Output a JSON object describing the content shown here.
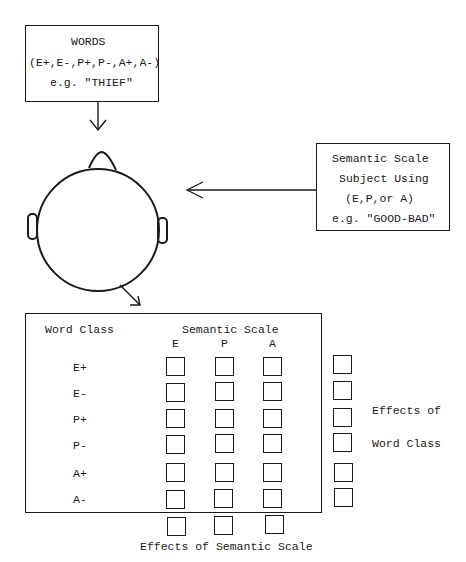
{
  "words_box": {
    "line1": "WORDS",
    "line2": "(E+,E-,P+,P-,A+,A-)",
    "line3": "e.g. \"THIEF\""
  },
  "scale_box": {
    "line1": "Semantic Scale",
    "line2": "Subject Using",
    "line3": "(E,P,or A)",
    "line4": "e.g. \"GOOD-BAD\""
  },
  "matrix": {
    "row_header": "Word Class",
    "col_header": "Semantic Scale",
    "columns": [
      "E",
      "P",
      "A"
    ],
    "rows": [
      "E+",
      "E-",
      "P+",
      "P-",
      "A+",
      "A-"
    ]
  },
  "labels": {
    "word_class_effects_1": "Effects of",
    "word_class_effects_2": "Word Class",
    "semantic_scale_effects": "Effects of Semantic Scale"
  },
  "icons": {
    "head": "head-top-view-icon",
    "arrow_down": "arrow-down-icon",
    "arrow_left": "arrow-left-icon",
    "arrow_diag": "arrow-down-right-icon"
  }
}
